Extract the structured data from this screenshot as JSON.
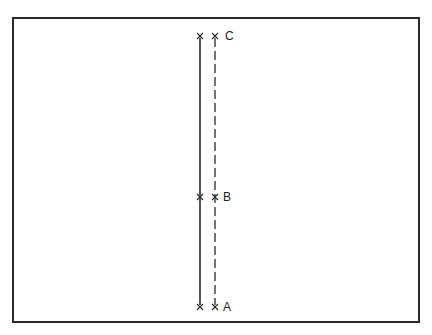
{
  "diagram": {
    "type": "two-line route diagram",
    "lines": [
      {
        "name": "solid-line",
        "style": "solid",
        "x": 200
      },
      {
        "name": "dashed-line",
        "style": "dashed",
        "x": 215
      }
    ],
    "points": [
      {
        "label": "C",
        "y": 36
      },
      {
        "label": "B",
        "y": 197
      },
      {
        "label": "A",
        "y": 307
      }
    ],
    "marker": "×",
    "colors": {
      "stroke": "#2a2a2a",
      "background": "#ffffff"
    }
  }
}
